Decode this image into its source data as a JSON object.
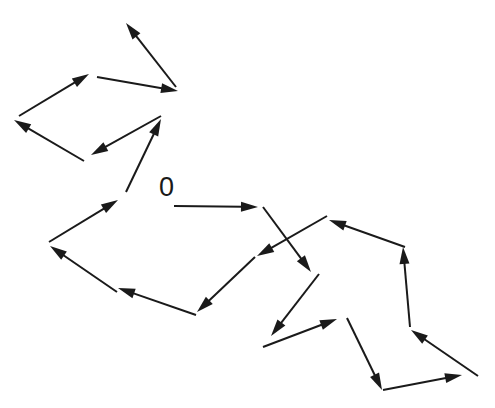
{
  "diagram": {
    "title": "",
    "origin_label": "0",
    "origin_label_pos": {
      "x": 159,
      "y": 174
    },
    "stroke_color": "#1a1a1a",
    "background": "#ffffff",
    "arrows": [
      {
        "from": [
          174,
          206
        ],
        "to": [
          258,
          207
        ]
      },
      {
        "from": [
          263,
          207
        ],
        "to": [
          311,
          272
        ]
      },
      {
        "from": [
          319,
          274
        ],
        "to": [
          271,
          336
        ]
      },
      {
        "from": [
          263,
          347
        ],
        "to": [
          337,
          319
        ]
      },
      {
        "from": [
          347,
          318
        ],
        "to": [
          382,
          390
        ]
      },
      {
        "from": [
          383,
          390
        ],
        "to": [
          462,
          375
        ]
      },
      {
        "from": [
          478,
          376
        ],
        "to": [
          411,
          330
        ]
      },
      {
        "from": [
          410,
          327
        ],
        "to": [
          403,
          247
        ]
      },
      {
        "from": [
          405,
          247
        ],
        "to": [
          329,
          220
        ]
      },
      {
        "from": [
          327,
          216
        ],
        "to": [
          257,
          256
        ]
      },
      {
        "from": [
          255,
          257
        ],
        "to": [
          197,
          312
        ]
      },
      {
        "from": [
          196,
          315
        ],
        "to": [
          118,
          288
        ]
      },
      {
        "from": [
          117,
          292
        ],
        "to": [
          50,
          246
        ]
      },
      {
        "from": [
          49,
          242
        ],
        "to": [
          118,
          200
        ]
      },
      {
        "from": [
          126,
          192
        ],
        "to": [
          161,
          119
        ]
      },
      {
        "from": [
          161,
          116
        ],
        "to": [
          91,
          155
        ]
      },
      {
        "from": [
          84,
          161
        ],
        "to": [
          14,
          120
        ]
      },
      {
        "from": [
          19,
          116
        ],
        "to": [
          89,
          74
        ]
      },
      {
        "from": [
          97,
          77
        ],
        "to": [
          178,
          91
        ]
      },
      {
        "from": [
          176,
          87
        ],
        "to": [
          126,
          23
        ]
      }
    ]
  }
}
